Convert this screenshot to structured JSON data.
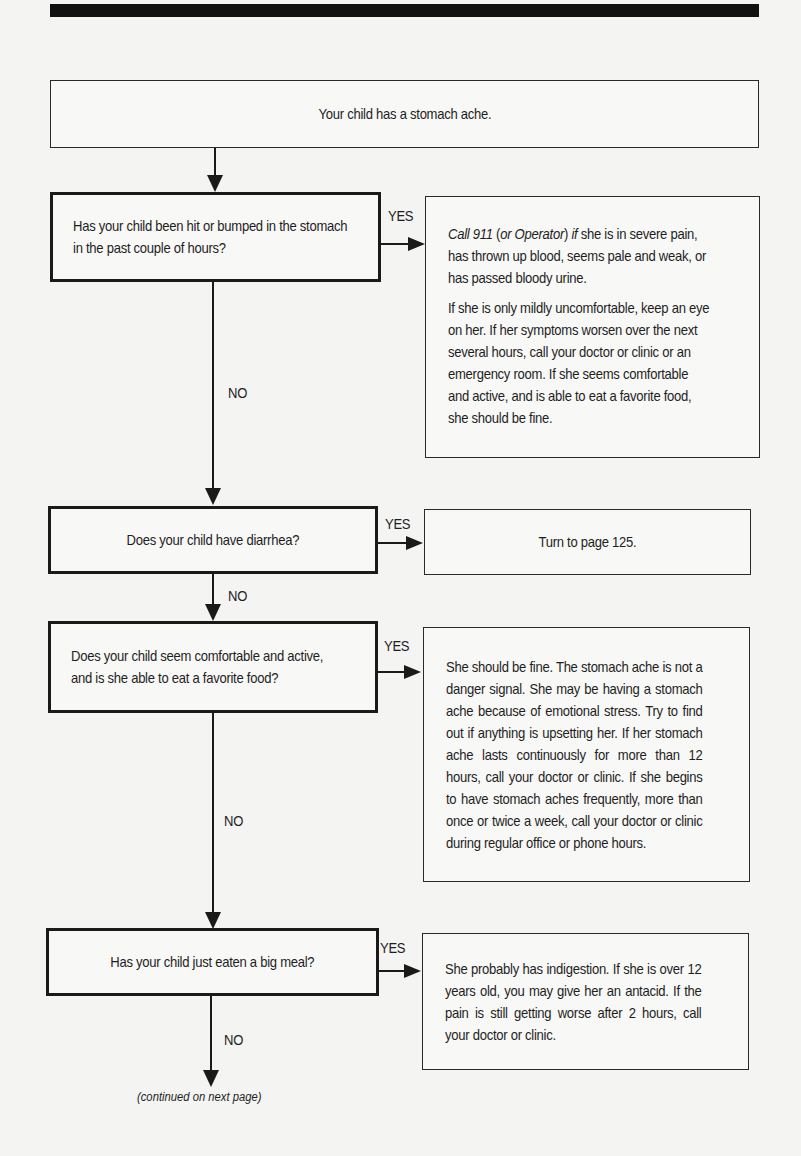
{
  "flowchart": {
    "start": {
      "text": "Your child has a stomach ache."
    },
    "questions": [
      {
        "text": "Has your child been hit or bumped in the stomach in the past couple of hours?",
        "yes_label": "YES",
        "no_label": "NO",
        "answer": {
          "p1_italic_1": "Call 911",
          "p1_plain_1": " (",
          "p1_italic_2": "or Operator",
          "p1_plain_2": ") ",
          "p1_italic_3": "if",
          "p1_rest": " she is in severe pain, has thrown up blood, seems pale and weak, or has passed bloody urine.",
          "p2": "If she is only mildly uncomfortable, keep an eye on her. If her symptoms worsen over the next several hours, call your doctor or clinic or an emergency room. If she seems comfortable and active, and is able to eat a favorite food, she should be fine."
        }
      },
      {
        "text": "Does your child have diarrhea?",
        "yes_label": "YES",
        "no_label": "NO",
        "answer": {
          "text": "Turn to page 125."
        }
      },
      {
        "text": "Does your child seem comfortable and active, and is she able to eat a favorite food?",
        "yes_label": "YES",
        "no_label": "NO",
        "answer": {
          "text": "She should be fine. The stomach ache is not a danger signal. She may be having a stomach ache because of emotional stress. Try to find out if anything is upsetting her. If her stomach ache lasts continuously for more than 12 hours, call your doctor or clinic. If she begins to have stomach aches frequently, more than once or twice a week, call your doctor or clinic during regular office or phone hours."
        }
      },
      {
        "text": "Has your child just eaten a big meal?",
        "yes_label": "YES",
        "no_label": "NO",
        "answer": {
          "text": "She probably has indigestion. If she is over 12 years old, you may give her an antacid. If the pain is still getting worse after 2 hours, call your doctor or clinic."
        }
      }
    ],
    "continued": "(continued on next page)"
  }
}
